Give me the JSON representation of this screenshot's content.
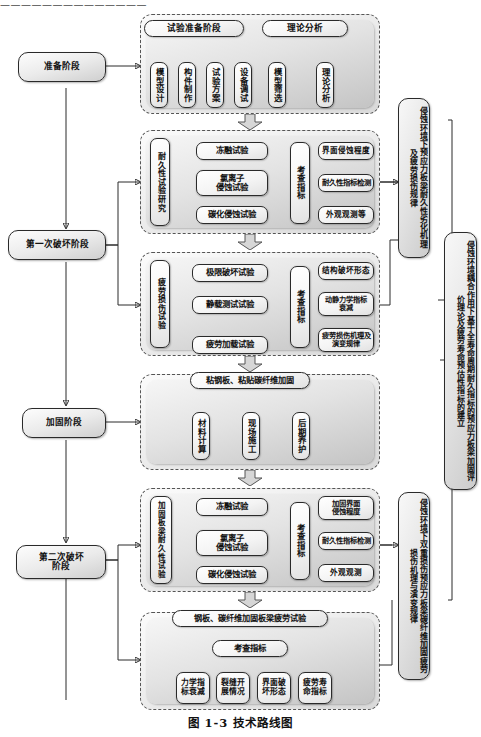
{
  "page": {
    "top_cut_text": "——————————————",
    "caption": "图 1-3  技术路线图"
  },
  "stages": [
    {
      "key": "prep",
      "label": "准备阶段"
    },
    {
      "key": "damage1",
      "label": "第一次破坏阶段"
    },
    {
      "key": "strengthen",
      "label": "加固阶段"
    },
    {
      "key": "damage2",
      "label": "第二次破坏\n阶段"
    }
  ],
  "panels": [
    {
      "key": "panel-preparation",
      "groups": [
        {
          "key": "test-preparation",
          "header": "试验准备阶段",
          "items": [
            "模型设计",
            "构件制作",
            "试验方案",
            "设备调试"
          ]
        },
        {
          "key": "theory-analysis",
          "header": "理论分析",
          "items": [
            "模型筛选",
            "理论分析"
          ]
        }
      ]
    },
    {
      "key": "panel-durability",
      "left_label": "耐久性试验研究",
      "tests": [
        "冻融试验",
        "氯离子\n侵蚀试验",
        "碳化侵蚀试验"
      ],
      "center_label": "考查指标",
      "indicators": [
        "界面侵蚀程度",
        "耐久性指标检测",
        "外观观测等"
      ]
    },
    {
      "key": "panel-fatigue",
      "left_label": "疲劳损伤试验",
      "tests": [
        "极限破坏试验",
        "静载测试试验",
        "疲劳加载试验"
      ],
      "center_label": "考查指标",
      "indicators": [
        "结构破坏形态",
        "动静力学指标\n衰减",
        "疲劳损伤机理及\n演变规律"
      ]
    },
    {
      "key": "panel-reinforce",
      "header": "粘钢板、粘贴碳纤维加固",
      "items": [
        "材料计算",
        "现场施工",
        "后期养护"
      ]
    },
    {
      "key": "panel-reinforced-durability",
      "left_label": "加固板梁耐久性试验",
      "tests": [
        "冻融试验",
        "氯离子\n侵蚀试验",
        "碳化侵蚀试验"
      ],
      "center_label": "考查指标",
      "indicators": [
        "加固界面\n侵蚀程度",
        "耐久性指标检测",
        "外观观测"
      ]
    },
    {
      "key": "panel-reinforced-fatigue",
      "header": "钢板、碳纤维加固板梁疲劳试验",
      "center_label": "考查指标",
      "items": [
        "力学指标衰减",
        "裂缝开展情况",
        "界面破坏形态",
        "疲劳寿命指标"
      ]
    }
  ],
  "conclusions": [
    {
      "key": "conclusion-1",
      "text": "侵蚀环境下预应力板梁耐久性劣化机理及疲劳损伤规律"
    },
    {
      "key": "conclusion-2",
      "text": "侵蚀环境耦合作用下基于全寿命周期耐久指标的预应力板梁加固评价理论及疲劳寿命预估性指标的建立"
    },
    {
      "key": "conclusion-3",
      "text": "侵蚀环境下双重损伤预应力板梁碳纤维加固疲劳损伤机理与演变规律"
    }
  ]
}
